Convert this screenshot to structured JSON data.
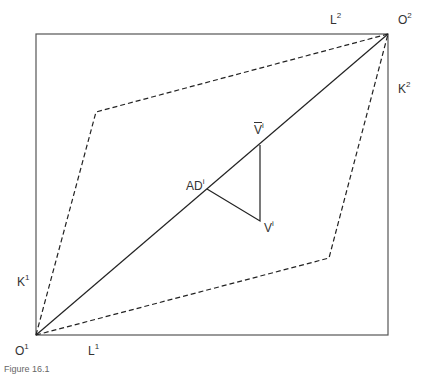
{
  "diagram": {
    "type": "edgeworth-box",
    "box": {
      "x1": 36,
      "y1": 34,
      "x2": 388,
      "y2": 335
    },
    "diagonal": {
      "from": [
        36,
        335
      ],
      "to": [
        388,
        34
      ]
    },
    "lens_dashed": [
      [
        36,
        335
      ],
      [
        96,
        112
      ],
      [
        388,
        34
      ],
      [
        329,
        258
      ],
      [
        36,
        335
      ]
    ],
    "triangle": {
      "AD": [
        207,
        189
      ],
      "Vbar": [
        260,
        145
      ],
      "V": [
        260,
        221
      ]
    },
    "stroke_color": "#222222"
  },
  "labels": {
    "O1": {
      "base": "O",
      "sup": "1"
    },
    "L1": {
      "base": "L",
      "sup": "1"
    },
    "K1": {
      "base": "K",
      "sup": "1"
    },
    "O2": {
      "base": "O",
      "sup": "2"
    },
    "L2": {
      "base": "L",
      "sup": "2"
    },
    "K2": {
      "base": "K",
      "sup": "2"
    },
    "AD": {
      "base": "AD",
      "sup": "i"
    },
    "Vbar": {
      "base": "V",
      "sup": "i"
    },
    "V": {
      "base": "V",
      "sup": "i"
    }
  },
  "caption": "Figure 16.1"
}
